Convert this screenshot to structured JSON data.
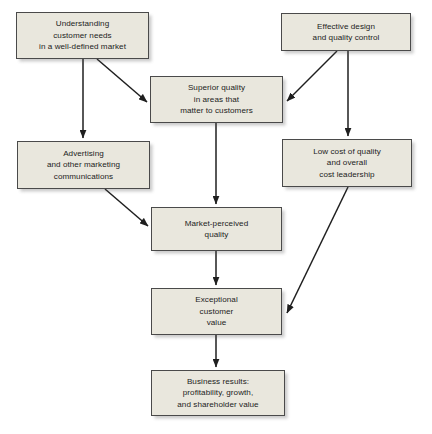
{
  "diagram": {
    "background_color": "#ffffff",
    "node_fill_color": "#e9e7dd",
    "node_border_color": "#4a4a4a",
    "edge_color": "#1f1f1f",
    "nodes": [
      {
        "id": "understanding",
        "label": "Understanding\ncustomer needs\nin a well-defined market"
      },
      {
        "id": "effective",
        "label": "Effective design\nand quality control"
      },
      {
        "id": "superior",
        "label": "Superior quality\nin areas that\nmatter to customers"
      },
      {
        "id": "advertising",
        "label": "Advertising\nand other marketing\ncommunications"
      },
      {
        "id": "lowcost",
        "label": "Low cost of quality\nand overall\ncost leadership"
      },
      {
        "id": "marketperceived",
        "label": "Market-perceived\nquality"
      },
      {
        "id": "exceptional",
        "label": "Exceptional\ncustomer\nvalue"
      },
      {
        "id": "business",
        "label": "Business results:\nprofitability, growth,\nand shareholder value"
      }
    ],
    "edges": [
      {
        "id": "understanding-to-advertising",
        "from": "understanding",
        "to": "advertising",
        "kind": "vertical"
      },
      {
        "id": "understanding-to-superior",
        "from": "understanding",
        "to": "superior",
        "kind": "diagonal"
      },
      {
        "id": "effective-to-superior",
        "from": "effective",
        "to": "superior",
        "kind": "diagonal"
      },
      {
        "id": "effective-to-lowcost",
        "from": "effective",
        "to": "lowcost",
        "kind": "vertical"
      },
      {
        "id": "superior-to-marketperceived",
        "from": "superior",
        "to": "marketperceived",
        "kind": "vertical"
      },
      {
        "id": "advertising-to-marketperceived",
        "from": "advertising",
        "to": "marketperceived",
        "kind": "diagonal"
      },
      {
        "id": "lowcost-to-exceptional",
        "from": "lowcost",
        "to": "exceptional",
        "kind": "diagonal"
      },
      {
        "id": "marketperceived-to-exceptional",
        "from": "marketperceived",
        "to": "exceptional",
        "kind": "vertical"
      },
      {
        "id": "exceptional-to-business",
        "from": "exceptional",
        "to": "business",
        "kind": "vertical"
      }
    ]
  }
}
